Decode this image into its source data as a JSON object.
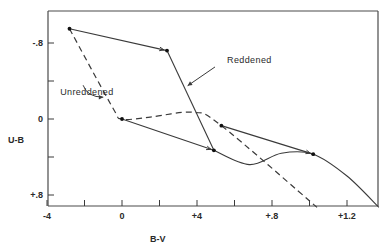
{
  "chart_data": {
    "type": "line",
    "title": "",
    "xlabel": "B-V",
    "ylabel": "U-B",
    "xlim": [
      -0.4,
      1.45
    ],
    "ylim": [
      -1.0,
      0.92
    ],
    "y_inverted": true,
    "grid": false,
    "x_ticks": [
      {
        "value": -0.4,
        "label": "-4"
      },
      {
        "value": -0.2,
        "label": ""
      },
      {
        "value": 0.0,
        "label": "0"
      },
      {
        "value": 0.2,
        "label": ""
      },
      {
        "value": 0.4,
        "label": "+4"
      },
      {
        "value": 0.6,
        "label": ""
      },
      {
        "value": 0.8,
        "label": "+.8"
      },
      {
        "value": 1.0,
        "label": ""
      },
      {
        "value": 1.2,
        "label": "+1.2"
      }
    ],
    "y_ticks": [
      {
        "value": -0.8,
        "label": "-.8"
      },
      {
        "value": -0.4,
        "label": ""
      },
      {
        "value": 0.0,
        "label": "0"
      },
      {
        "value": 0.4,
        "label": ""
      },
      {
        "value": 0.8,
        "label": "+.8"
      }
    ],
    "series": [
      {
        "name": "Unreddened",
        "style": "dashed",
        "points": [
          [
            -0.28,
            -0.95
          ],
          [
            -0.05,
            -0.12
          ],
          [
            0.0,
            0.0
          ],
          [
            0.15,
            -0.02
          ],
          [
            0.38,
            -0.07
          ],
          [
            0.53,
            0.07
          ],
          [
            1.04,
            0.93
          ]
        ]
      },
      {
        "name": "Intrinsic curve",
        "style": "solid",
        "points": [
          [
            0.24,
            -0.72
          ],
          [
            0.49,
            0.33
          ],
          [
            0.68,
            0.48
          ],
          [
            0.85,
            0.36
          ],
          [
            1.02,
            0.37
          ],
          [
            1.2,
            0.6
          ],
          [
            1.37,
            0.93
          ]
        ]
      },
      {
        "name": "Reddened",
        "style": "solid-arrows",
        "segments": [
          {
            "from": [
              -0.28,
              -0.95
            ],
            "to": [
              0.24,
              -0.72
            ]
          },
          {
            "from": [
              0.0,
              0.0
            ],
            "to": [
              0.49,
              0.33
            ]
          },
          {
            "from": [
              0.53,
              0.07
            ],
            "to": [
              1.02,
              0.37
            ]
          }
        ]
      }
    ],
    "marked_points": [
      [
        -0.28,
        -0.95
      ],
      [
        0.24,
        -0.72
      ],
      [
        0.0,
        0.0
      ],
      [
        0.49,
        0.33
      ],
      [
        0.53,
        0.07
      ],
      [
        1.02,
        0.37
      ]
    ],
    "annotations": [
      {
        "text": "Reddened",
        "at": [
          0.56,
          -0.59
        ],
        "arrow_to": [
          0.35,
          -0.35
        ]
      },
      {
        "text": "Unreddened",
        "at": [
          -0.33,
          -0.25
        ],
        "arrow_to": [
          -0.1,
          -0.23
        ]
      }
    ]
  }
}
